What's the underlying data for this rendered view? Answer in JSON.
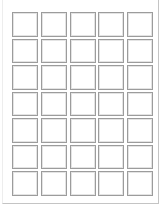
{
  "sheet": {
    "type": "label-template",
    "columns": 5,
    "rows": 7,
    "label_shape": "square",
    "labels": [
      {
        "row": 1,
        "col": 1
      },
      {
        "row": 1,
        "col": 2
      },
      {
        "row": 1,
        "col": 3
      },
      {
        "row": 1,
        "col": 4
      },
      {
        "row": 1,
        "col": 5
      },
      {
        "row": 2,
        "col": 1
      },
      {
        "row": 2,
        "col": 2
      },
      {
        "row": 2,
        "col": 3
      },
      {
        "row": 2,
        "col": 4
      },
      {
        "row": 2,
        "col": 5
      },
      {
        "row": 3,
        "col": 1
      },
      {
        "row": 3,
        "col": 2
      },
      {
        "row": 3,
        "col": 3
      },
      {
        "row": 3,
        "col": 4
      },
      {
        "row": 3,
        "col": 5
      },
      {
        "row": 4,
        "col": 1
      },
      {
        "row": 4,
        "col": 2
      },
      {
        "row": 4,
        "col": 3
      },
      {
        "row": 4,
        "col": 4
      },
      {
        "row": 4,
        "col": 5
      },
      {
        "row": 5,
        "col": 1
      },
      {
        "row": 5,
        "col": 2
      },
      {
        "row": 5,
        "col": 3
      },
      {
        "row": 5,
        "col": 4
      },
      {
        "row": 5,
        "col": 5
      },
      {
        "row": 6,
        "col": 1
      },
      {
        "row": 6,
        "col": 2
      },
      {
        "row": 6,
        "col": 3
      },
      {
        "row": 6,
        "col": 4
      },
      {
        "row": 6,
        "col": 5
      },
      {
        "row": 7,
        "col": 1
      },
      {
        "row": 7,
        "col": 2
      },
      {
        "row": 7,
        "col": 3
      },
      {
        "row": 7,
        "col": 4
      },
      {
        "row": 7,
        "col": 5
      }
    ]
  },
  "colors": {
    "page": "#ffffff",
    "label_border": "#9c9c9c",
    "page_edge": "#c4c4c4"
  }
}
